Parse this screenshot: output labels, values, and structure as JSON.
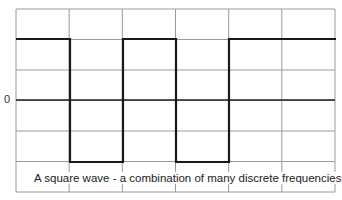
{
  "diagram": {
    "y_axis_label": "0",
    "caption": "A square wave - a combination of many discrete frequencies",
    "grid": {
      "left": 16,
      "right": 335,
      "top": 9,
      "bottom": 192,
      "columns": 6,
      "rows": 6,
      "color": "#9a9a9a"
    },
    "wave": {
      "high_y": 39,
      "low_y": 162,
      "zero_y": 100,
      "transitions_x": [
        16,
        70,
        123,
        176,
        229,
        282
      ],
      "color": "#1a1a1a"
    }
  },
  "chart_data": {
    "type": "line",
    "title": "A square wave - a combination of many discrete frequencies",
    "xlabel": "",
    "ylabel": "",
    "y_tick_labels": [
      "0"
    ],
    "grid": true,
    "series": [
      {
        "name": "square wave",
        "x": [
          0,
          1,
          1,
          2,
          2,
          3,
          3,
          4,
          4,
          5
        ],
        "values": [
          1,
          1,
          -1,
          -1,
          1,
          1,
          -1,
          -1,
          1,
          1
        ]
      },
      {
        "name": "zero line",
        "x": [
          0,
          6
        ],
        "values": [
          0,
          0
        ]
      }
    ],
    "xlim": [
      0,
      6
    ],
    "ylim": [
      -1.5,
      1.5
    ]
  }
}
